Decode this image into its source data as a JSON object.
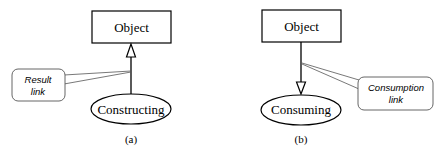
{
  "diagram_a": {
    "object_label": "Object",
    "process_label": "Constructing",
    "callout_line1": "Result",
    "callout_line2": "link",
    "caption": "(a)"
  },
  "diagram_b": {
    "object_label": "Object",
    "process_label": "Consuming",
    "callout_line1": "Consumption",
    "callout_line2": "link",
    "caption": "(b)"
  },
  "colors": {
    "stroke": "#000000",
    "callout_stroke": "#555555",
    "background": "#ffffff"
  }
}
